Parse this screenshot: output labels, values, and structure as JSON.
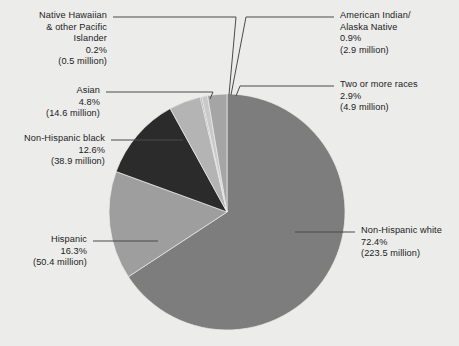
{
  "figure": {
    "background_color": "#ececeb",
    "text_color": "#1b1b1b",
    "leader_line_color": "#4a4a4a"
  },
  "chart_data": {
    "type": "pie",
    "title": "",
    "subtitle": "",
    "xlabel": "",
    "ylabel": "",
    "legend_position": "callout-labels",
    "grid": false,
    "units": "percent of U.S. population",
    "value_unit": "million people",
    "start_angle_deg": 0,
    "direction": "clockwise",
    "categories": [
      "Non-Hispanic white",
      "Hispanic",
      "Non-Hispanic black",
      "Asian",
      "Native Hawaiian & other Pacific Islander",
      "American Indian/Alaska Native",
      "Two or more races"
    ],
    "values": [
      72.4,
      16.3,
      12.6,
      4.8,
      0.2,
      0.9,
      2.9
    ],
    "counts_millions": [
      223.5,
      50.4,
      38.9,
      14.6,
      0.5,
      2.9,
      4.9
    ],
    "slice_colors": [
      "#7d7d7d",
      "#9e9e9e",
      "#2b2b2b",
      "#b4b4b4",
      "#8f8f8f",
      "#c9c9c9",
      "#a5a5a5"
    ],
    "slices": [
      {
        "id": "non-hispanic-white",
        "name": "Non-Hispanic white",
        "percent_label": "72.4%",
        "count_label": "(223.5 million)",
        "value": 72.4,
        "count_millions": 223.5,
        "color": "#7d7d7d"
      },
      {
        "id": "hispanic",
        "name": "Hispanic",
        "percent_label": "16.3%",
        "count_label": "(50.4 million)",
        "value": 16.3,
        "count_millions": 50.4,
        "color": "#9e9e9e"
      },
      {
        "id": "non-hispanic-black",
        "name": "Non-Hispanic black",
        "percent_label": "12.6%",
        "count_label": "(38.9 million)",
        "value": 12.6,
        "count_millions": 38.9,
        "color": "#2b2b2b"
      },
      {
        "id": "asian",
        "name": "Asian",
        "percent_label": "4.8%",
        "count_label": "(14.6 million)",
        "value": 4.8,
        "count_millions": 14.6,
        "color": "#b4b4b4"
      },
      {
        "id": "native-hawaiian-pacific-islander",
        "name_line1": "Native Hawaiian",
        "name_line2": "& other Pacific",
        "name_line3": "Islander",
        "name": "Native Hawaiian & other Pacific Islander",
        "percent_label": "0.2%",
        "count_label": "(0.5 million)",
        "value": 0.2,
        "count_millions": 0.5,
        "color": "#8f8f8f"
      },
      {
        "id": "american-indian-alaska-native",
        "name_line1": "American Indian/",
        "name_line2": "Alaska Native",
        "name": "American Indian/Alaska Native",
        "percent_label": "0.9%",
        "count_label": "(2.9 million)",
        "value": 0.9,
        "count_millions": 2.9,
        "color": "#c9c9c9"
      },
      {
        "id": "two-or-more-races",
        "name": "Two or more races",
        "percent_label": "2.9%",
        "count_label": "(4.9 million)",
        "value": 2.9,
        "count_millions": 4.9,
        "color": "#a5a5a5"
      }
    ]
  }
}
